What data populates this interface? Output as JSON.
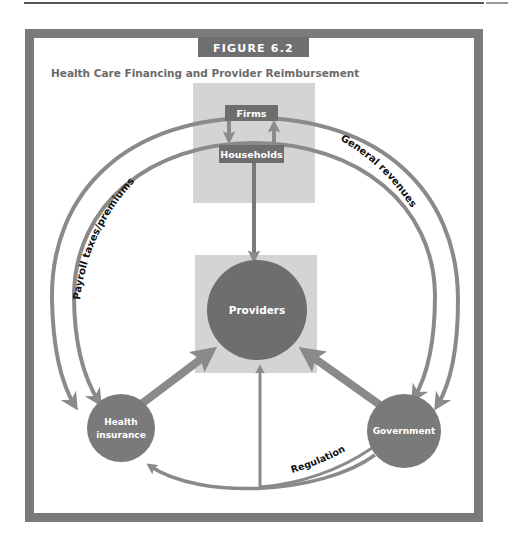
{
  "figure": {
    "number_label": "FIGURE 6.2",
    "title": "Health Care Financing and Provider Reimbursement"
  },
  "nodes": {
    "firms": "Firms",
    "households": "Households",
    "providers": "Providers",
    "health_insurance": [
      "Health",
      "insurance"
    ],
    "government": "Government"
  },
  "flows": {
    "payroll": "Payroll taxes/premiums",
    "general_revenues": "General revenues",
    "regulation": "Regulation"
  },
  "colors": {
    "frame": "#7a7a7a",
    "node_dark": "#6e6e6e",
    "box_light": "#d4d4d4",
    "arrow": "#8a8a8a",
    "header_bg": "#6f6f6f",
    "title_text": "#6a6a6a"
  }
}
